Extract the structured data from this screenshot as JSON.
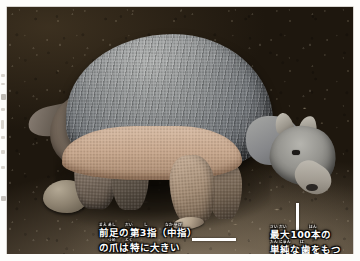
{
  "page": {
    "kind": "scanned-book-page",
    "paper_color": "#fdfdfb"
  },
  "photo": {
    "subject": "giant-armadillo",
    "scene": "dark soil ground",
    "alt": "ヒメアルマジロ科の大型アルマジロが暗い土の上に立っている写真",
    "colors": {
      "carapace": "#8d9091",
      "flank_band": "#c8a88e",
      "ground_dark": "#241c12",
      "ground_light": "#9d8b70",
      "caption_text": "#ffffff",
      "leader_line": "#ffffff"
    }
  },
  "annotations": [
    {
      "id": "claw",
      "ruby_line1": "まえあし　　だい　　 し　　　　なかゆび",
      "line1": "前足の第3指（中指）",
      "ruby_line2": "　　つめ　　とく",
      "line2": "の爪は特に大きい",
      "leader": "horizontal-line",
      "points_to": "front-foot-third-claw"
    },
    {
      "id": "teeth",
      "ruby_line1": "さいだい　　　　　ほん",
      "line1": "最大100本の",
      "ruby_line2": "たんじゅん　　は",
      "line2": "単純な歯をもつ",
      "leader": "vertical-line",
      "points_to": "snout-mouth"
    }
  ]
}
